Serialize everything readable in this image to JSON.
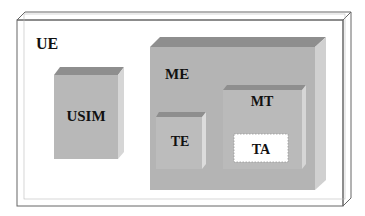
{
  "diagram": {
    "ue": {
      "label": "UE"
    },
    "usim": {
      "label": "USIM"
    },
    "me": {
      "label": "ME"
    },
    "te": {
      "label": "TE"
    },
    "mt": {
      "label": "MT"
    },
    "ta": {
      "label": "TA"
    }
  },
  "colors": {
    "box_front": "#b8b8b8",
    "box_top": "#8e8e8e",
    "box_side": "#d2d2d2",
    "outline": "#555555",
    "ta_fill": "#ffffff"
  }
}
